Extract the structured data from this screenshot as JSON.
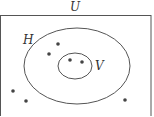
{
  "diagram": {
    "type": "venn",
    "universe": {
      "label": "U",
      "x": 0.5,
      "y": 15.5,
      "w": 150.5,
      "h": 110
    },
    "sets": [
      {
        "id": "H",
        "label": "H",
        "cx": 77,
        "cy": 66,
        "rx": 53,
        "ry": 38,
        "label_x": 23,
        "label_y": 44
      },
      {
        "id": "V",
        "label": "V",
        "cx": 75,
        "cy": 66,
        "rx": 17,
        "ry": 13,
        "label_x": 95,
        "label_y": 70,
        "subset_of": "H"
      }
    ],
    "points": [
      {
        "region": "H only",
        "x": 58,
        "y": 44
      },
      {
        "region": "H only",
        "x": 49,
        "y": 54
      },
      {
        "region": "V",
        "x": 70,
        "y": 60
      },
      {
        "region": "V",
        "x": 82,
        "y": 62
      },
      {
        "region": "outside H",
        "x": 13,
        "y": 91
      },
      {
        "region": "outside H",
        "x": 26,
        "y": 101
      },
      {
        "region": "outside H",
        "x": 125,
        "y": 100
      }
    ],
    "colors": {
      "stroke": "#555555",
      "dot": "#444444",
      "text": "#333333"
    }
  }
}
